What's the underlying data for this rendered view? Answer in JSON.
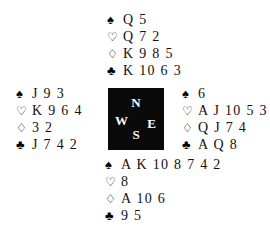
{
  "diagram": {
    "type": "bridge-deal-diagram",
    "background_color": "#ffffff",
    "text_color": "#111111"
  },
  "suits": {
    "spade": {
      "name": "spade-suit-symbol",
      "glyph": "♠",
      "style": "filled"
    },
    "heart": {
      "name": "heart-suit-symbol",
      "glyph": "♡",
      "style": "hollow"
    },
    "diamond": {
      "name": "diamond-suit-symbol",
      "glyph": "♢",
      "style": "hollow"
    },
    "club": {
      "name": "club-suit-symbol",
      "glyph": "♣",
      "style": "filled"
    }
  },
  "compass": {
    "background_color": "#0a0a0a",
    "label_color": "#ffffff",
    "north": "N",
    "west": "W",
    "east": "E",
    "south": "S"
  },
  "hands": {
    "north": {
      "position": "North",
      "spades": "Q 5",
      "hearts": "Q 7 2",
      "diamonds": "K 9 8 5",
      "clubs": "K 10 6 3"
    },
    "west": {
      "position": "West",
      "spades": "J 9 3",
      "hearts": "K 9 6 4",
      "diamonds": "3 2",
      "clubs": "J 7 4 2"
    },
    "east": {
      "position": "East",
      "spades": "6",
      "hearts": "A J 10 5 3",
      "diamonds": "Q J 7 4",
      "clubs": "A Q 8"
    },
    "south": {
      "position": "South",
      "spades": "A K 10 8 7 4 2",
      "hearts": "8",
      "diamonds": "A 10 6",
      "clubs": "9 5"
    }
  }
}
